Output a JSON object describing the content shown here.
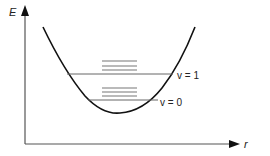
{
  "diagram": {
    "type": "potential-energy-curve",
    "axes": {
      "y_label": "E",
      "x_label": "r"
    },
    "levels": [
      {
        "label": "v = 1",
        "y": 74,
        "x1": 67,
        "x2": 173,
        "label_x": 177,
        "label_y": 79
      },
      {
        "label": "v = 0",
        "y": 100,
        "x1": 88,
        "x2": 158,
        "label_x": 160,
        "label_y": 106
      }
    ],
    "sublevels": [
      {
        "group": "v = 1",
        "ys": [
          61,
          66,
          70
        ],
        "x1": 102,
        "x2": 137
      },
      {
        "group": "v = 0",
        "ys": [
          88,
          92,
          96
        ],
        "x1": 102,
        "x2": 137
      }
    ],
    "colors": {
      "curve": "#111111",
      "axis": "#555555",
      "level": "#666666",
      "text": "#222222"
    }
  }
}
